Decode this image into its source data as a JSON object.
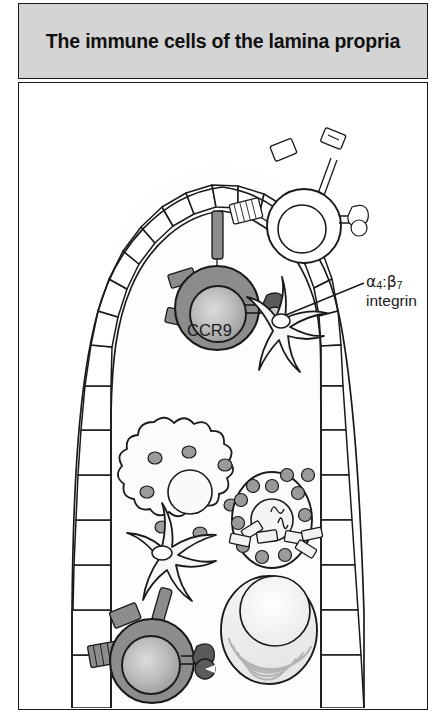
{
  "figure": {
    "title": "The immune cells of the lamina propria",
    "panel_background": "#ffffff",
    "title_bar_color": "#d4d4d4",
    "border_color": "#1a1a1a"
  },
  "labels": {
    "ccr9": "CCR9",
    "integrin": {
      "alpha": "α",
      "alpha_sub": "4",
      "separator": ":",
      "beta": "β",
      "beta_sub": "7",
      "second_line": "integrin"
    }
  },
  "structures": {
    "villus": {
      "name": "intestinal villus",
      "epithelium_cell_count": 44,
      "epithelium_fill": "#ffffff",
      "epithelium_stroke": "#1a1a1a",
      "lamina_propria_fill": "#fdfdfd"
    }
  },
  "cells": [
    {
      "id": "lymphocyte-upper-left",
      "type": "lymphocyte",
      "fill": "#8c8c8c",
      "nucleus_fill": "#b8b8b8",
      "has_receptors": true,
      "receptor_count": 3
    },
    {
      "id": "lymphocyte-upper-right",
      "type": "lymphocyte",
      "fill": "#ffffff",
      "nucleus_fill": "#ffffff",
      "has_receptors": true,
      "receptor_count": 3
    },
    {
      "id": "macrophage",
      "type": "macrophage",
      "fill": "#fbfbfb",
      "granule_count": 8,
      "granule_fill": "#9a9a9a"
    },
    {
      "id": "granulocyte",
      "type": "granulocyte",
      "fill": "#fbfbfb",
      "granule_count": 14,
      "granule_fill": "#9a9a9a"
    },
    {
      "id": "dendritic-cell-upper",
      "type": "dendritic cell",
      "fill": "#f7f7f7",
      "process_count": 5
    },
    {
      "id": "dendritic-cell-lower",
      "type": "dendritic cell",
      "fill": "#f7f7f7",
      "process_count": 6
    },
    {
      "id": "iga-dimer",
      "type": "dimeric IgA antibody",
      "fill": "#f2f2f2"
    },
    {
      "id": "plasma-cell",
      "type": "plasma cell",
      "fill": "#f0f0f0",
      "nucleus_fill": "#fafafa",
      "er_arc_count": 5
    },
    {
      "id": "lymphocyte-lower-left",
      "type": "lymphocyte",
      "fill": "#8c8c8c",
      "nucleus_fill": "#b8b8b8",
      "has_receptors": true,
      "receptor_count": 3
    }
  ]
}
